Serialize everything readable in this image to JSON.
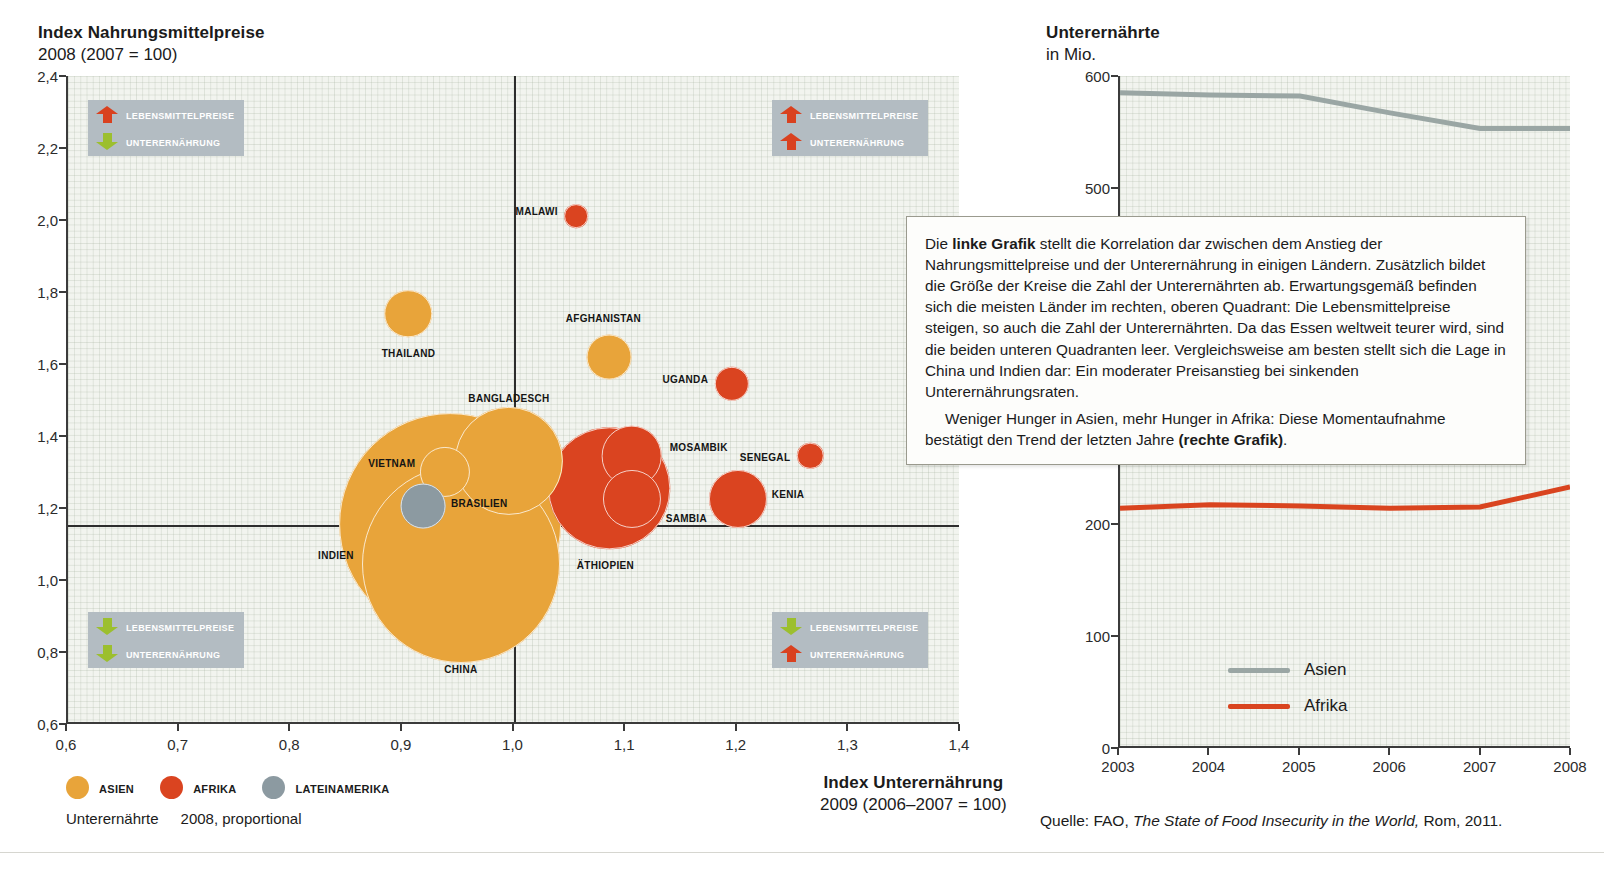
{
  "left_chart": {
    "title": "Index Nahrungsmittelpreise",
    "subtitle": "2008 (2007 = 100)",
    "x_axis_title": "Index Unterernährung",
    "x_axis_subtitle": "2009 (2006–2007 = 100)",
    "y_ticks": [
      "2,4",
      "2,2",
      "2,0",
      "1,8",
      "1,6",
      "1,4",
      "1,2",
      "1,0",
      "0,8",
      "0,6"
    ],
    "x_ticks": [
      "0,6",
      "0,7",
      "0,8",
      "0,9",
      "1,0",
      "1,1",
      "1,2",
      "1,3",
      "1,4"
    ],
    "quadrants": [
      {
        "name": "top-left",
        "lines": [
          {
            "arrow": "up",
            "color": "red",
            "label": "Lebensmittelpreise"
          },
          {
            "arrow": "down",
            "color": "green",
            "label": "Unterernährung"
          }
        ]
      },
      {
        "name": "top-right",
        "lines": [
          {
            "arrow": "up",
            "color": "red",
            "label": "Lebensmittelpreise"
          },
          {
            "arrow": "up",
            "color": "red",
            "label": "Unterernährung"
          }
        ]
      },
      {
        "name": "bottom-left",
        "lines": [
          {
            "arrow": "down",
            "color": "green",
            "label": "Lebensmittelpreise"
          },
          {
            "arrow": "down",
            "color": "green",
            "label": "Unterernährung"
          }
        ]
      },
      {
        "name": "bottom-right",
        "lines": [
          {
            "arrow": "down",
            "color": "green",
            "label": "Lebensmittelpreise"
          },
          {
            "arrow": "up",
            "color": "red",
            "label": "Unterernährung"
          }
        ]
      }
    ],
    "legend": [
      {
        "label": "Asien",
        "color": "#e8a43a"
      },
      {
        "label": "Afrika",
        "color": "#da4420"
      },
      {
        "label": "Lateinamerika",
        "color": "#8c9aa1"
      }
    ],
    "size_note_label": "Unterernährte",
    "size_note_value": "2008, proportional"
  },
  "right_chart": {
    "title": "Unterernährte",
    "subtitle": "in Mio.",
    "y_ticks": [
      "600",
      "500",
      "200",
      "100",
      "0"
    ],
    "x_ticks": [
      "2003",
      "2004",
      "2005",
      "2006",
      "2007",
      "2008"
    ],
    "legend": [
      {
        "label": "Asien",
        "color": "#9aa6a4"
      },
      {
        "label": "Afrika",
        "color": "#d9441f"
      }
    ]
  },
  "callout": {
    "p1_a": "Die ",
    "p1_b": "linke Grafik",
    "p1_c": " stellt die Korrelation dar zwischen dem Anstieg der Nahrungsmittelpreise und der Unterernährung in einigen Ländern. Zusätzlich bildet die Größe der Kreise die Zahl der Unterernährten ab. Erwartungsgemäß befinden sich die meisten Länder im rechten, oberen Quadrant: Die Lebensmittelpreise steigen, so auch die Zahl der Unterernährten. Da das Essen weltweit teurer wird, sind die beiden unteren Quadranten leer. Vergleichsweise am besten stellt sich die Lage in China und Indien dar: Ein moderater Preisanstieg bei sinkenden Unterernährungsraten.",
    "p2_a": "Weniger Hunger in Asien, mehr Hunger in Afrika: Diese Momentaufnahme bestätigt den Trend der letzten Jahre ",
    "p2_b": "(rechte Grafik)",
    "p2_c": "."
  },
  "source": {
    "prefix": "Quelle: FAO, ",
    "italic": "The State of Food Insecurity in the World,",
    "suffix": " Rom, 2011."
  },
  "chart_data": [
    {
      "type": "scatter",
      "title": "Index Nahrungsmittelpreise 2008 (2007 = 100) vs. Index Unterernährung 2009 (2006–2007 = 100)",
      "xlabel": "Index Unterernährung 2009 (2006–2007 = 100)",
      "ylabel": "Index Nahrungsmittelpreise 2008 (2007 = 100)",
      "xlim": [
        0.6,
        1.4
      ],
      "ylim": [
        0.6,
        2.4
      ],
      "grid": true,
      "legend_position": "below-left",
      "bubble_meaning": "Unterernährte 2008, proportional",
      "reference_lines": {
        "x": 1.0,
        "y": 1.0
      },
      "points": [
        {
          "label": "Malawi",
          "x": 1.055,
          "y": 2.01,
          "region": "Afrika",
          "size": 18,
          "label_pos": "left"
        },
        {
          "label": "Thailand",
          "x": 0.905,
          "y": 1.74,
          "region": "Asien",
          "size": 36,
          "label_pos": "below"
        },
        {
          "label": "Afghanistan",
          "x": 1.085,
          "y": 1.62,
          "region": "Asien",
          "size": 34,
          "label_pos": "above"
        },
        {
          "label": "Uganda",
          "x": 1.195,
          "y": 1.545,
          "region": "Afrika",
          "size": 26,
          "label_pos": "left"
        },
        {
          "label": "Bangladesch",
          "x": 0.995,
          "y": 1.33,
          "region": "Asien",
          "size": 82,
          "label_pos": "above"
        },
        {
          "label": "Mosambik",
          "x": 1.105,
          "y": 1.345,
          "region": "Afrika",
          "size": 46,
          "label_pos": "right"
        },
        {
          "label": "Senegal",
          "x": 1.265,
          "y": 1.345,
          "region": "Afrika",
          "size": 20,
          "label_pos": "left"
        },
        {
          "label": "Vietnam",
          "x": 0.938,
          "y": 1.3,
          "region": "Asien",
          "size": 38,
          "label_pos": "left"
        },
        {
          "label": "Äthiopien",
          "x": 1.085,
          "y": 1.255,
          "region": "Afrika",
          "size": 92,
          "label_pos": "below"
        },
        {
          "label": "Sambia",
          "x": 1.105,
          "y": 1.225,
          "region": "Afrika",
          "size": 44,
          "label_pos": "right"
        },
        {
          "label": "Kenia",
          "x": 1.2,
          "y": 1.225,
          "region": "Afrika",
          "size": 44,
          "label_pos": "right"
        },
        {
          "label": "Brasilien",
          "x": 0.918,
          "y": 1.205,
          "region": "Lateinamerika",
          "size": 34,
          "label_pos": "right"
        },
        {
          "label": "Indien",
          "x": 0.942,
          "y": 1.155,
          "region": "Asien",
          "size": 168,
          "label_pos": "left"
        },
        {
          "label": "China",
          "x": 0.952,
          "y": 1.045,
          "region": "Asien",
          "size": 150,
          "label_pos": "below"
        }
      ]
    },
    {
      "type": "line",
      "title": "Unterernährte in Mio.",
      "xlabel": "",
      "ylabel": "in Mio.",
      "x": [
        "2003",
        "2004",
        "2005",
        "2006",
        "2007",
        "2008"
      ],
      "xlim": [
        2003,
        2008
      ],
      "ylim": [
        0,
        600
      ],
      "grid": true,
      "legend_position": "bottom-center",
      "series": [
        {
          "name": "Asien",
          "color": "#9aa6a4",
          "values": [
            585,
            583,
            582,
            567,
            553,
            553
          ]
        },
        {
          "name": "Afrika",
          "color": "#d9441f",
          "values": [
            213,
            216,
            215,
            213,
            214,
            232
          ]
        }
      ]
    }
  ]
}
